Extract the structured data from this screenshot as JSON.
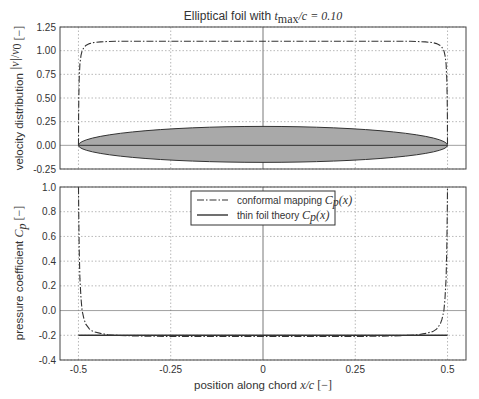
{
  "chart_data": [
    {
      "type": "line",
      "title": "Elliptical foil with t_max/c = 0.10",
      "title_parts": {
        "prefix": "Elliptical foil with ",
        "t": "t",
        "sub": "max",
        "rest": "/c = 0.10"
      },
      "xlabel": "",
      "ylabel": "velocity distribution |v|/v0 [−]",
      "ylabel_parts": {
        "text": "velocity distribution",
        "frac_num": "|v|",
        "frac_den": "v",
        "frac_den_sub": "0",
        "unit": "[−]"
      },
      "xlim": [
        -0.55,
        0.55
      ],
      "ylim": [
        -0.25,
        1.25
      ],
      "yticks": [
        -0.25,
        0.0,
        0.25,
        0.5,
        0.75,
        1.0,
        1.25
      ],
      "ytick_labels": [
        "-0.25",
        "0.00",
        "0.25",
        "0.50",
        "0.75",
        "1.00",
        "1.25"
      ],
      "xgrid": [
        -0.5,
        -0.25,
        0,
        0.25,
        0.5
      ],
      "grid": true,
      "series": [
        {
          "name": "conformal mapping |v|/v0",
          "style": "dashdot",
          "x": [
            -0.5,
            -0.4995,
            -0.499,
            -0.498,
            -0.496,
            -0.493,
            -0.49,
            -0.485,
            -0.48,
            -0.47,
            -0.46,
            -0.44,
            -0.42,
            -0.4,
            -0.35,
            -0.3,
            -0.2,
            -0.1,
            0,
            0.1,
            0.2,
            0.3,
            0.35,
            0.4,
            0.42,
            0.44,
            0.46,
            0.47,
            0.48,
            0.485,
            0.49,
            0.493,
            0.496,
            0.498,
            0.499,
            0.4995,
            0.5
          ],
          "y": [
            0.0,
            0.3,
            0.5,
            0.7,
            0.86,
            0.95,
            1.0,
            1.035,
            1.055,
            1.075,
            1.085,
            1.093,
            1.097,
            1.099,
            1.1,
            1.1,
            1.1,
            1.1,
            1.1,
            1.1,
            1.1,
            1.1,
            1.1,
            1.099,
            1.097,
            1.093,
            1.085,
            1.075,
            1.055,
            1.035,
            1.0,
            0.95,
            0.86,
            0.7,
            0.5,
            0.3,
            0.0
          ]
        }
      ],
      "shapes": [
        {
          "name": "elliptical foil profile",
          "type": "ellipse",
          "cx": 0.0,
          "cy": 0.0,
          "rx": 0.5,
          "ry_top": 0.2,
          "ry_bottom": 0.18,
          "fill": "#a9a9a9",
          "stroke": "#333333"
        }
      ]
    },
    {
      "type": "line",
      "xlabel": "position along chord x/c [−]",
      "xlabel_parts": {
        "text": "position along chord ",
        "math": "x/c",
        "unit": "[−]"
      },
      "ylabel": "pressure coefficient Cp [−]",
      "ylabel_parts": {
        "text": "pressure coefficient ",
        "math": "C",
        "sub": "p",
        "unit": "[−]"
      },
      "xlim": [
        -0.55,
        0.55
      ],
      "ylim": [
        -0.4,
        1.0
      ],
      "xticks": [
        -0.5,
        -0.25,
        0,
        0.25,
        0.5
      ],
      "xtick_labels": [
        "-0.5",
        "-0.25",
        "0",
        "0.25",
        "0.5"
      ],
      "yticks": [
        -0.4,
        -0.2,
        0.0,
        0.2,
        0.4,
        0.6,
        0.8,
        1.0
      ],
      "ytick_labels": [
        "-0.4",
        "-0.2",
        "0.0",
        "0.2",
        "0.4",
        "0.6",
        "0.8",
        "1.0"
      ],
      "grid": true,
      "legend": {
        "position": "upper center",
        "entries": [
          {
            "label": "conformal mapping Cp(x)",
            "text": "conformal mapping ",
            "math": "C",
            "sub": "p",
            "arg": "(x)",
            "style": "dashdot"
          },
          {
            "label": "thin foil theory Cp(x)",
            "text": "thin foil theory ",
            "math": "C",
            "sub": "p",
            "arg": "(x)",
            "style": "solid"
          }
        ]
      },
      "series": [
        {
          "name": "conformal mapping Cp(x)",
          "style": "dashdot",
          "x": [
            -0.5,
            -0.4995,
            -0.499,
            -0.498,
            -0.496,
            -0.493,
            -0.49,
            -0.485,
            -0.48,
            -0.47,
            -0.46,
            -0.44,
            -0.42,
            -0.4,
            -0.35,
            -0.3,
            -0.2,
            -0.1,
            0,
            0.1,
            0.2,
            0.3,
            0.35,
            0.4,
            0.42,
            0.44,
            0.46,
            0.47,
            0.48,
            0.485,
            0.49,
            0.493,
            0.496,
            0.498,
            0.499,
            0.4995,
            0.5
          ],
          "y": [
            1.0,
            0.9,
            0.75,
            0.5,
            0.26,
            0.1,
            0.0,
            -0.07,
            -0.11,
            -0.15,
            -0.17,
            -0.185,
            -0.195,
            -0.2,
            -0.205,
            -0.208,
            -0.21,
            -0.21,
            -0.21,
            -0.21,
            -0.21,
            -0.208,
            -0.205,
            -0.2,
            -0.195,
            -0.185,
            -0.17,
            -0.15,
            -0.11,
            -0.07,
            0.0,
            0.1,
            0.26,
            0.5,
            0.75,
            0.9,
            1.0
          ]
        },
        {
          "name": "thin foil theory Cp(x)",
          "style": "solid",
          "x": [
            -0.5,
            0.5
          ],
          "y": [
            -0.2,
            -0.2
          ]
        }
      ]
    }
  ]
}
